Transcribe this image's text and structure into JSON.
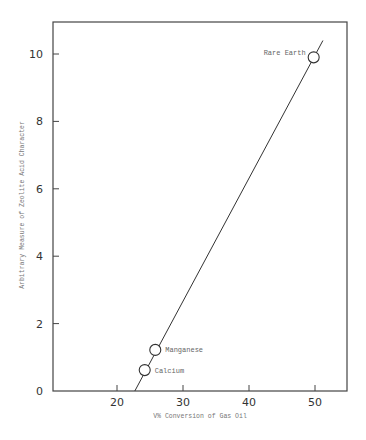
{
  "chart_data": {
    "type": "scatter",
    "title": "",
    "xlabel": "V% Conversion of Gas Oil",
    "ylabel": "Arbitrary Measure of Zeolite Acid Character",
    "xlim": [
      10,
      55
    ],
    "ylim": [
      0,
      11
    ],
    "x_ticks": [
      20,
      30,
      40,
      50
    ],
    "y_ticks": [
      0,
      2,
      4,
      6,
      8,
      10
    ],
    "grid": false,
    "legend": null,
    "points": [
      {
        "label": "Calcium",
        "x": 24.2,
        "y": 0.62
      },
      {
        "label": "Manganese",
        "x": 25.8,
        "y": 1.22
      },
      {
        "label": "Rare Earth",
        "x": 49.8,
        "y": 9.9
      }
    ],
    "fit_line": {
      "x": [
        22.7,
        51.2
      ],
      "y": [
        0,
        10.4
      ]
    }
  },
  "colors": {
    "frame": "#444444",
    "line": "#333333",
    "text": "#666666"
  }
}
